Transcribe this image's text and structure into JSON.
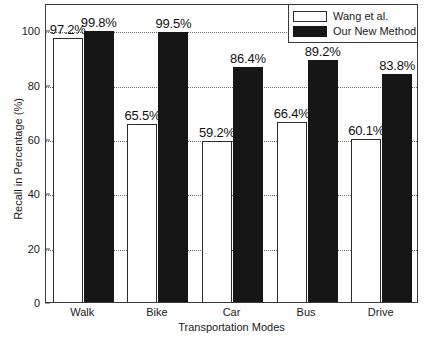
{
  "chart_data": {
    "type": "bar",
    "title": "",
    "xlabel": "Transportation Modes",
    "ylabel": "Recall in Percentage (%)",
    "categories": [
      "Walk",
      "Bike",
      "Car",
      "Bus",
      "Drive"
    ],
    "series": [
      {
        "name": "Wang et al.",
        "color": "#ffffff",
        "values": [
          97.2,
          65.5,
          59.2,
          66.4,
          60.1
        ],
        "labels": [
          "97.2%",
          "65.5%",
          "59.2%",
          "66.4%",
          "60.1%"
        ]
      },
      {
        "name": "Our New Method",
        "color": "#161616",
        "values": [
          99.8,
          99.5,
          86.4,
          89.2,
          83.8
        ],
        "labels": [
          "99.8%",
          "99.5%",
          "86.4%",
          "89.2%",
          "83.8%"
        ]
      }
    ],
    "ylim": [
      0,
      110
    ],
    "yticks": [
      0,
      20,
      40,
      60,
      80,
      100
    ],
    "ytick_labels": [
      "0",
      "20",
      "40",
      "60",
      "80",
      "100"
    ],
    "grid": true,
    "grid_style": "dotted",
    "legend_position": "top-right"
  },
  "legend": {
    "entries": [
      {
        "label": "Wang et al."
      },
      {
        "label": "Our New Method"
      }
    ]
  }
}
